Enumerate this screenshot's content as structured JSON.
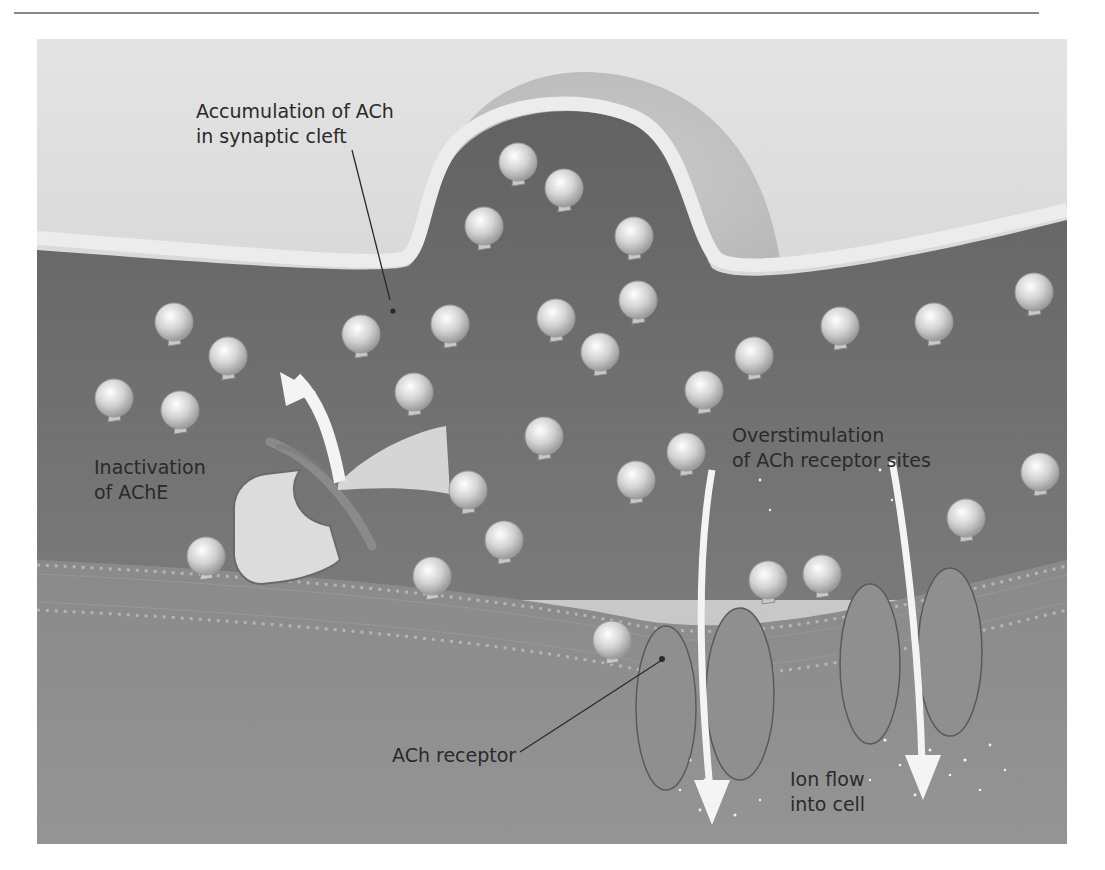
{
  "figure": {
    "labels": {
      "accumulation": [
        "Accumulation of ACh",
        "in synaptic cleft"
      ],
      "inactivation": [
        "Inactivation",
        "of AChE"
      ],
      "overstimulation": [
        "Overstimulation",
        "of ACh receptor sites"
      ],
      "receptor": [
        "ACh receptor"
      ],
      "ion_flow": [
        "Ion flow",
        "into cell"
      ]
    },
    "colors": {
      "background_light": "#d9d9d9",
      "presynaptic": "#c4c4c4",
      "cleft": "#6f6f6f",
      "membrane": "#e6e6e6",
      "postsynaptic": "#8c8c8c",
      "molecule": "#dcdcdc",
      "receptor": "#8f8f8f",
      "text": "#2a2a2a"
    },
    "molecules": [
      [
        518,
        162
      ],
      [
        564,
        188
      ],
      [
        484,
        226
      ],
      [
        634,
        236
      ],
      [
        638,
        300
      ],
      [
        556,
        318
      ],
      [
        450,
        324
      ],
      [
        361,
        334
      ],
      [
        600,
        352
      ],
      [
        174,
        322
      ],
      [
        228,
        356
      ],
      [
        114,
        398
      ],
      [
        180,
        410
      ],
      [
        414,
        392
      ],
      [
        704,
        390
      ],
      [
        754,
        356
      ],
      [
        840,
        326
      ],
      [
        934,
        322
      ],
      [
        1034,
        292
      ],
      [
        544,
        436
      ],
      [
        468,
        490
      ],
      [
        636,
        480
      ],
      [
        686,
        452
      ],
      [
        504,
        540
      ],
      [
        206,
        556
      ],
      [
        432,
        576
      ],
      [
        612,
        640
      ],
      [
        768,
        580
      ],
      [
        822,
        574
      ],
      [
        966,
        518
      ],
      [
        1040,
        472
      ]
    ],
    "receptors": [
      {
        "cx": 666,
        "cy": 708,
        "rx": 30,
        "ry": 82
      },
      {
        "cx": 740,
        "cy": 694,
        "rx": 34,
        "ry": 86
      },
      {
        "cx": 870,
        "cy": 664,
        "rx": 30,
        "ry": 80
      },
      {
        "cx": 950,
        "cy": 652,
        "rx": 32,
        "ry": 84
      }
    ]
  }
}
